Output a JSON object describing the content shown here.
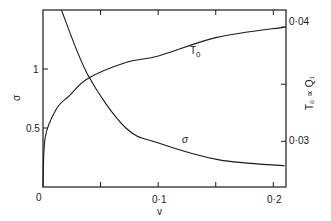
{
  "chart_data": {
    "type": "line",
    "title": "",
    "xlabel": "v",
    "ylabel": "σ",
    "ylabel_right": "T₀ ∝ Q₁",
    "xlim": [
      0,
      0.211
    ],
    "ylim": [
      0,
      1.5
    ],
    "ylim_right": [
      0.026,
      0.0415
    ],
    "x_ticks": [
      0,
      0.05,
      0.1,
      0.15,
      0.2
    ],
    "x_tick_labels": [
      "0",
      "",
      "0·1",
      "",
      "0·2"
    ],
    "y_ticks": [
      0,
      0.5,
      1
    ],
    "y_tick_labels": [
      "0",
      "0.5",
      "1"
    ],
    "y_right_ticks": [
      0.03,
      0.035,
      0.04
    ],
    "y_right_tick_labels": [
      "0·03",
      "",
      "0·04"
    ],
    "grid": false,
    "legend": "none (curves labeled inline)",
    "series": [
      {
        "name": "T₀",
        "axis": "right",
        "inline_label": "T₀",
        "x": [
          0,
          0.002,
          0.012,
          0.023,
          0.039,
          0.072,
          0.101,
          0.151,
          0.21
        ],
        "values": [
          0.026,
          0.0304,
          0.0329,
          0.034,
          0.0355,
          0.0369,
          0.0375,
          0.0391,
          0.04
        ]
      },
      {
        "name": "σ",
        "axis": "left",
        "inline_label": "σ",
        "x": [
          0.016,
          0.039,
          0.072,
          0.101,
          0.153,
          0.21
        ],
        "values": [
          1.5,
          0.95,
          0.5,
          0.37,
          0.23,
          0.18
        ]
      }
    ]
  },
  "labels": {
    "x_axis_title": "v",
    "y_axis_title": "σ",
    "y_right_axis_title": "T₀ ∝ Q₁",
    "x_tick_0": "0",
    "x_tick_1": "0·1",
    "x_tick_2": "0·2",
    "y_tick_half": "0.5",
    "y_tick_one": "1",
    "y_right_tick_low": "0·03",
    "y_right_tick_high": "0·04",
    "curve_label_T0": "T",
    "curve_label_T0_sub": "0",
    "curve_label_sigma": "σ"
  }
}
